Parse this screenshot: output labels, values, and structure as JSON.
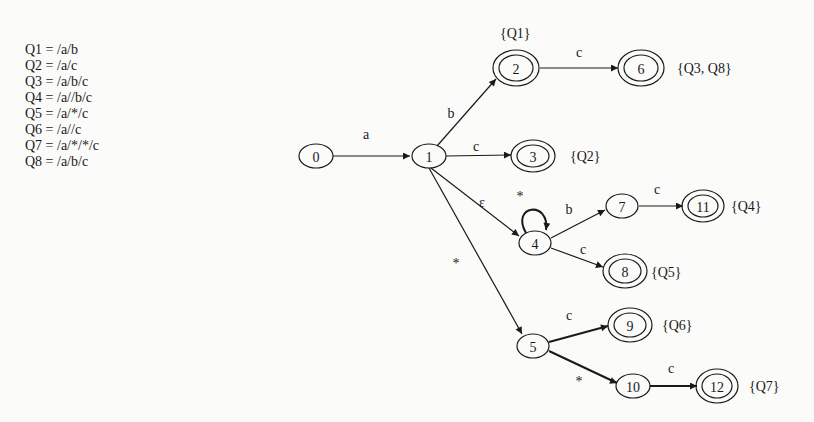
{
  "queries": [
    {
      "name": "Q1",
      "expr": "Q1 = /a/b"
    },
    {
      "name": "Q2",
      "expr": "Q2 = /a/c"
    },
    {
      "name": "Q3",
      "expr": "Q3 = /a/b/c"
    },
    {
      "name": "Q4",
      "expr": "Q4 = /a//b/c"
    },
    {
      "name": "Q5",
      "expr": "Q5 = /a/*/c"
    },
    {
      "name": "Q6",
      "expr": "Q6 = /a//c"
    },
    {
      "name": "Q7",
      "expr": "Q7 = /a/*/*/c"
    },
    {
      "name": "Q8",
      "expr": "Q8 = /a/b/c"
    }
  ],
  "nodes": {
    "n0": {
      "label": "0",
      "accepting": false
    },
    "n1": {
      "label": "1",
      "accepting": false
    },
    "n2": {
      "label": "2",
      "accepting": true,
      "queries": "{Q1}"
    },
    "n3": {
      "label": "3",
      "accepting": true,
      "queries": "{Q2}"
    },
    "n4": {
      "label": "4",
      "accepting": false
    },
    "n5": {
      "label": "5",
      "accepting": false
    },
    "n6": {
      "label": "6",
      "accepting": true,
      "queries": "{Q3, Q8}"
    },
    "n7": {
      "label": "7",
      "accepting": false
    },
    "n8": {
      "label": "8",
      "accepting": true,
      "queries": "{Q5}"
    },
    "n9": {
      "label": "9",
      "accepting": true,
      "queries": "{Q6}"
    },
    "n10": {
      "label": "10",
      "accepting": false
    },
    "n11": {
      "label": "11",
      "accepting": true,
      "queries": "{Q4}"
    },
    "n12": {
      "label": "12",
      "accepting": true,
      "queries": "{Q7}"
    }
  },
  "edges": {
    "e0_1": {
      "from": "0",
      "to": "1",
      "label": "a"
    },
    "e1_2": {
      "from": "1",
      "to": "2",
      "label": "b"
    },
    "e1_3": {
      "from": "1",
      "to": "3",
      "label": "c"
    },
    "e1_4": {
      "from": "1",
      "to": "4",
      "label": "ε"
    },
    "e1_5": {
      "from": "1",
      "to": "5",
      "label": "*"
    },
    "e2_6": {
      "from": "2",
      "to": "6",
      "label": "c"
    },
    "e4_4": {
      "from": "4",
      "to": "4",
      "label": "*"
    },
    "e4_7": {
      "from": "4",
      "to": "7",
      "label": "b"
    },
    "e4_8": {
      "from": "4",
      "to": "8",
      "label": "c"
    },
    "e7_11": {
      "from": "7",
      "to": "11",
      "label": "c"
    },
    "e5_9": {
      "from": "5",
      "to": "9",
      "label": "c"
    },
    "e5_10": {
      "from": "5",
      "to": "10",
      "label": "*"
    },
    "e10_12": {
      "from": "10",
      "to": "12",
      "label": "c"
    }
  },
  "colors": {
    "ink": "#1a1a1a",
    "background": "#fbfbfa"
  }
}
